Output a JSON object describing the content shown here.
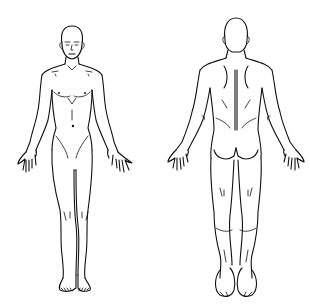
{
  "figure": {
    "type": "body-outline-diagram",
    "views": [
      {
        "id": "front",
        "label": "Anterior view"
      },
      {
        "id": "back",
        "label": "Posterior view"
      }
    ],
    "colors": {
      "background": "#ffffff",
      "line": "#111111"
    }
  }
}
